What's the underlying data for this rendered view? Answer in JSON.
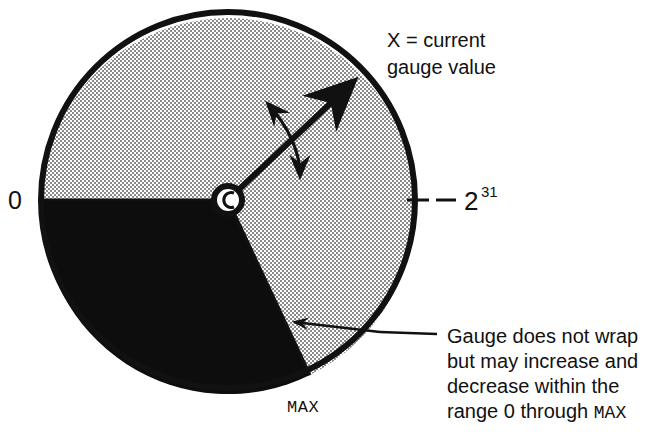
{
  "figure": {
    "title_semantic": "gauge-wrap-diagram",
    "colors": {
      "ink": "#111111",
      "paper": "#ffffff",
      "sector_fill_black": "#0d0d0d",
      "sector_fill_gray": "#c9c9c9"
    }
  },
  "dial": {
    "zero_label": "0",
    "max_label": "MAX",
    "upper_limit_base": "2",
    "upper_limit_exponent": "31",
    "upper_limit_full": "2^31",
    "center_hub_name": "needle-pivot",
    "needle_name": "gauge-needle",
    "oscillation_arrow_name": "double-headed-curved-arrow"
  },
  "annotations": {
    "needle_callout": {
      "lines": [
        "X = current",
        "gauge value"
      ]
    },
    "range_callout": {
      "lines": [
        {
          "text": "Gauge does not wrap",
          "mono_tail": ""
        },
        {
          "text": "but may increase and",
          "mono_tail": ""
        },
        {
          "text": "decrease within the",
          "mono_tail": ""
        },
        {
          "text": "range 0 through ",
          "mono_tail": "MAX"
        }
      ]
    }
  }
}
